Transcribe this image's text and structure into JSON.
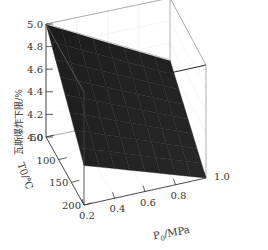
{
  "chart_data": {
    "type": "surface3d",
    "title": "",
    "zlabel": "瓦斯爆炸下限/%",
    "xlabel": "P0/MPa",
    "xlabel_main": "P",
    "xlabel_sub": "0",
    "xlabel_unit": "/MPa",
    "ylabel": "T0/℃",
    "xlim": [
      0.2,
      1.0
    ],
    "ylim": [
      50,
      200
    ],
    "zlim": [
      4.0,
      5.0
    ],
    "x_ticks": [
      "0.2",
      "0.4",
      "0.6",
      "0.8",
      "1.0"
    ],
    "y_ticks": [
      "50",
      "100",
      "150",
      "200"
    ],
    "z_ticks": [
      "4.0",
      "4.2",
      "4.4",
      "4.6",
      "4.8",
      "5.0"
    ],
    "surface_corners": [
      {
        "P0": 0.2,
        "T0": 50,
        "LEL": 5.0
      },
      {
        "P0": 0.2,
        "T0": 200,
        "LEL": 4.35
      },
      {
        "P0": 1.0,
        "T0": 50,
        "LEL": 4.45
      },
      {
        "P0": 1.0,
        "T0": 200,
        "LEL": 4.0
      }
    ],
    "surface_color": "#1e1e1e",
    "grid": true
  }
}
